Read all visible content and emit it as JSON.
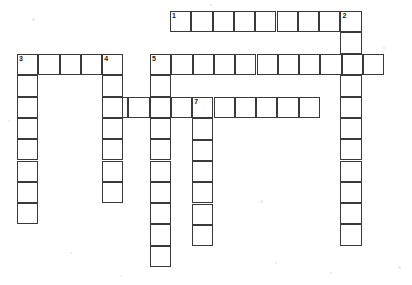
{
  "puzzle": {
    "title": "Crossword Puzzle Grid",
    "type": "crossword-grid",
    "width": 412,
    "height": 285,
    "cell_size": 21.3,
    "grid_color": "#3a3a3a",
    "cell_fill": "#ffffff",
    "background": "#ffffff",
    "number_color": "#1a1a1a",
    "numbers_visible": [
      "1",
      "2",
      "3",
      "4",
      "5",
      "6",
      "7"
    ],
    "entries": [
      {
        "number": "1",
        "direction": "across",
        "length": 9,
        "start_x": 170,
        "start_y": 11,
        "clue": "",
        "answer": ""
      },
      {
        "number": "2",
        "direction": "down",
        "length": 10,
        "start_x": 340,
        "start_y": 11,
        "clue": "",
        "answer": ""
      },
      {
        "number": "3",
        "direction": "across",
        "length": 5,
        "start_x": 17,
        "start_y": 54,
        "clue": "",
        "answer": ""
      },
      {
        "number": "3",
        "direction": "down",
        "length": 8,
        "start_x": 17,
        "start_y": 54,
        "clue": "",
        "answer": ""
      },
      {
        "number": "4",
        "direction": "down",
        "length": 7,
        "start_x": 102,
        "start_y": 54,
        "clue": "",
        "answer": ""
      },
      {
        "number": "5",
        "direction": "across",
        "length": 11,
        "start_x": 150,
        "start_y": 54,
        "clue": "",
        "answer": ""
      },
      {
        "number": "5",
        "direction": "down",
        "length": 9,
        "start_x": 150,
        "start_y": 54,
        "clue": "",
        "answer": ""
      },
      {
        "number": "6",
        "direction": "across",
        "length": 10,
        "start_x": 107,
        "start_y": 97,
        "clue": "",
        "answer": ""
      },
      {
        "number": "7",
        "direction": "down",
        "length": 7,
        "start_x": 192,
        "start_y": 97,
        "clue": "",
        "answer": ""
      }
    ],
    "cells": [
      {
        "id": "r1c1",
        "x": 170.0,
        "y": 11.0,
        "n": "1",
        "letter": ""
      },
      {
        "id": "r1c2",
        "x": 191.3,
        "y": 11.0,
        "n": "",
        "letter": ""
      },
      {
        "id": "r1c3",
        "x": 212.6,
        "y": 11.0,
        "n": "",
        "letter": ""
      },
      {
        "id": "r1c4",
        "x": 233.9,
        "y": 11.0,
        "n": "",
        "letter": ""
      },
      {
        "id": "r1c5",
        "x": 255.2,
        "y": 11.0,
        "n": "",
        "letter": ""
      },
      {
        "id": "r1c6",
        "x": 276.5,
        "y": 11.0,
        "n": "",
        "letter": ""
      },
      {
        "id": "r1c7",
        "x": 297.8,
        "y": 11.0,
        "n": "",
        "letter": ""
      },
      {
        "id": "r1c8",
        "x": 319.1,
        "y": 11.0,
        "n": "",
        "letter": ""
      },
      {
        "id": "r1c9",
        "x": 340.4,
        "y": 11.0,
        "n": "2",
        "letter": ""
      },
      {
        "id": "r3c1",
        "x": 17.0,
        "y": 54.0,
        "n": "3",
        "letter": ""
      },
      {
        "id": "r3c2",
        "x": 38.3,
        "y": 54.0,
        "n": "",
        "letter": ""
      },
      {
        "id": "r3c3",
        "x": 59.6,
        "y": 54.0,
        "n": "",
        "letter": ""
      },
      {
        "id": "r3c4",
        "x": 80.9,
        "y": 54.0,
        "n": "",
        "letter": ""
      },
      {
        "id": "r3c5",
        "x": 102.2,
        "y": 54.0,
        "n": "4",
        "letter": ""
      },
      {
        "id": "r5c1",
        "x": 150.0,
        "y": 54.0,
        "n": "5",
        "letter": ""
      },
      {
        "id": "r5c2",
        "x": 171.3,
        "y": 54.0,
        "n": "",
        "letter": ""
      },
      {
        "id": "r5c3",
        "x": 192.6,
        "y": 54.0,
        "n": "",
        "letter": ""
      },
      {
        "id": "r5c4",
        "x": 213.9,
        "y": 54.0,
        "n": "",
        "letter": ""
      },
      {
        "id": "r5c5",
        "x": 235.2,
        "y": 54.0,
        "n": "",
        "letter": ""
      },
      {
        "id": "r5c6",
        "x": 256.5,
        "y": 54.0,
        "n": "",
        "letter": ""
      },
      {
        "id": "r5c7",
        "x": 277.8,
        "y": 54.0,
        "n": "",
        "letter": ""
      },
      {
        "id": "r5c8",
        "x": 299.1,
        "y": 54.0,
        "n": "",
        "letter": ""
      },
      {
        "id": "r5c9",
        "x": 320.4,
        "y": 54.0,
        "n": "",
        "letter": ""
      },
      {
        "id": "r5c10",
        "x": 341.7,
        "y": 54.0,
        "n": "",
        "letter": ""
      },
      {
        "id": "r5c11",
        "x": 363.0,
        "y": 54.0,
        "n": "",
        "letter": ""
      },
      {
        "id": "r6c1",
        "x": 107.0,
        "y": 97.0,
        "n": "6",
        "letter": ""
      },
      {
        "id": "r6c2",
        "x": 128.3,
        "y": 97.0,
        "n": "",
        "letter": ""
      },
      {
        "id": "r6c3",
        "x": 149.6,
        "y": 97.0,
        "n": "",
        "letter": ""
      },
      {
        "id": "r6c4",
        "x": 170.9,
        "y": 97.0,
        "n": "",
        "letter": ""
      },
      {
        "id": "r6c5",
        "x": 192.2,
        "y": 97.0,
        "n": "7",
        "letter": ""
      },
      {
        "id": "r6c6",
        "x": 213.5,
        "y": 97.0,
        "n": "",
        "letter": ""
      },
      {
        "id": "r6c7",
        "x": 234.8,
        "y": 97.0,
        "n": "",
        "letter": ""
      },
      {
        "id": "r6c8",
        "x": 256.1,
        "y": 97.0,
        "n": "",
        "letter": ""
      },
      {
        "id": "r6c9",
        "x": 277.4,
        "y": 97.0,
        "n": "",
        "letter": ""
      },
      {
        "id": "r6c10",
        "x": 298.7,
        "y": 97.0,
        "n": "",
        "letter": ""
      },
      {
        "id": "d3r2",
        "x": 17.0,
        "y": 75.3,
        "n": "",
        "letter": ""
      },
      {
        "id": "d3r3",
        "x": 17.0,
        "y": 96.6,
        "n": "",
        "letter": ""
      },
      {
        "id": "d3r4",
        "x": 17.0,
        "y": 117.9,
        "n": "",
        "letter": ""
      },
      {
        "id": "d3r5",
        "x": 17.0,
        "y": 139.2,
        "n": "",
        "letter": ""
      },
      {
        "id": "d3r6",
        "x": 17.0,
        "y": 160.5,
        "n": "",
        "letter": ""
      },
      {
        "id": "d3r7",
        "x": 17.0,
        "y": 181.8,
        "n": "",
        "letter": ""
      },
      {
        "id": "d3r8",
        "x": 17.0,
        "y": 203.1,
        "n": "",
        "letter": ""
      },
      {
        "id": "d4r2",
        "x": 102.2,
        "y": 75.3,
        "n": "",
        "letter": ""
      },
      {
        "id": "d4r3",
        "x": 102.2,
        "y": 96.6,
        "n": "",
        "letter": ""
      },
      {
        "id": "d4r4",
        "x": 102.2,
        "y": 117.9,
        "n": "",
        "letter": ""
      },
      {
        "id": "d4r5",
        "x": 102.2,
        "y": 139.2,
        "n": "",
        "letter": ""
      },
      {
        "id": "d4r6",
        "x": 102.2,
        "y": 160.5,
        "n": "",
        "letter": ""
      },
      {
        "id": "d4r7",
        "x": 102.2,
        "y": 181.8,
        "n": "",
        "letter": ""
      },
      {
        "id": "d5r2",
        "x": 150.0,
        "y": 75.3,
        "n": "",
        "letter": ""
      },
      {
        "id": "d5r3",
        "x": 150.0,
        "y": 96.6,
        "n": "",
        "letter": ""
      },
      {
        "id": "d5r4",
        "x": 150.0,
        "y": 117.9,
        "n": "",
        "letter": ""
      },
      {
        "id": "d5r5",
        "x": 150.0,
        "y": 139.2,
        "n": "",
        "letter": ""
      },
      {
        "id": "d5r6",
        "x": 150.0,
        "y": 160.5,
        "n": "",
        "letter": ""
      },
      {
        "id": "d5r7",
        "x": 150.0,
        "y": 181.8,
        "n": "",
        "letter": ""
      },
      {
        "id": "d5r8",
        "x": 150.0,
        "y": 203.1,
        "n": "",
        "letter": ""
      },
      {
        "id": "d5r9",
        "x": 150.0,
        "y": 224.4,
        "n": "",
        "letter": ""
      },
      {
        "id": "d5r10",
        "x": 150.0,
        "y": 245.7,
        "n": "",
        "letter": ""
      },
      {
        "id": "d7r2",
        "x": 192.2,
        "y": 118.3,
        "n": "",
        "letter": ""
      },
      {
        "id": "d7r3",
        "x": 192.2,
        "y": 139.6,
        "n": "",
        "letter": ""
      },
      {
        "id": "d7r4",
        "x": 192.2,
        "y": 160.9,
        "n": "",
        "letter": ""
      },
      {
        "id": "d7r5",
        "x": 192.2,
        "y": 182.2,
        "n": "",
        "letter": ""
      },
      {
        "id": "d7r6",
        "x": 192.2,
        "y": 203.5,
        "n": "",
        "letter": ""
      },
      {
        "id": "d7r7",
        "x": 192.2,
        "y": 224.8,
        "n": "",
        "letter": ""
      },
      {
        "id": "d2r2",
        "x": 340.4,
        "y": 32.3,
        "n": "",
        "letter": ""
      },
      {
        "id": "d2r4",
        "x": 340.4,
        "y": 75.3,
        "n": "",
        "letter": ""
      },
      {
        "id": "d2r5",
        "x": 340.4,
        "y": 96.6,
        "n": "",
        "letter": ""
      },
      {
        "id": "d2r6",
        "x": 340.4,
        "y": 117.9,
        "n": "",
        "letter": ""
      },
      {
        "id": "d2r7",
        "x": 340.4,
        "y": 139.2,
        "n": "",
        "letter": ""
      },
      {
        "id": "d2r8",
        "x": 340.4,
        "y": 160.5,
        "n": "",
        "letter": ""
      },
      {
        "id": "d2r9",
        "x": 340.4,
        "y": 181.8,
        "n": "",
        "letter": ""
      },
      {
        "id": "d2r10",
        "x": 340.4,
        "y": 203.1,
        "n": "",
        "letter": ""
      },
      {
        "id": "d2r11",
        "x": 340.4,
        "y": 224.4,
        "n": "",
        "letter": ""
      }
    ],
    "specks": [
      {
        "x": 32,
        "y": 18,
        "d": 3
      },
      {
        "x": 210,
        "y": 4,
        "d": 2
      },
      {
        "x": 260,
        "y": 200,
        "d": 3
      },
      {
        "x": 383,
        "y": 47,
        "d": 2
      },
      {
        "x": 70,
        "y": 252,
        "d": 2
      },
      {
        "x": 398,
        "y": 266,
        "d": 3
      },
      {
        "x": 120,
        "y": 275,
        "d": 2
      },
      {
        "x": 8,
        "y": 120,
        "d": 2
      },
      {
        "x": 275,
        "y": 262,
        "d": 2
      },
      {
        "x": 330,
        "y": 272,
        "d": 2
      }
    ]
  }
}
